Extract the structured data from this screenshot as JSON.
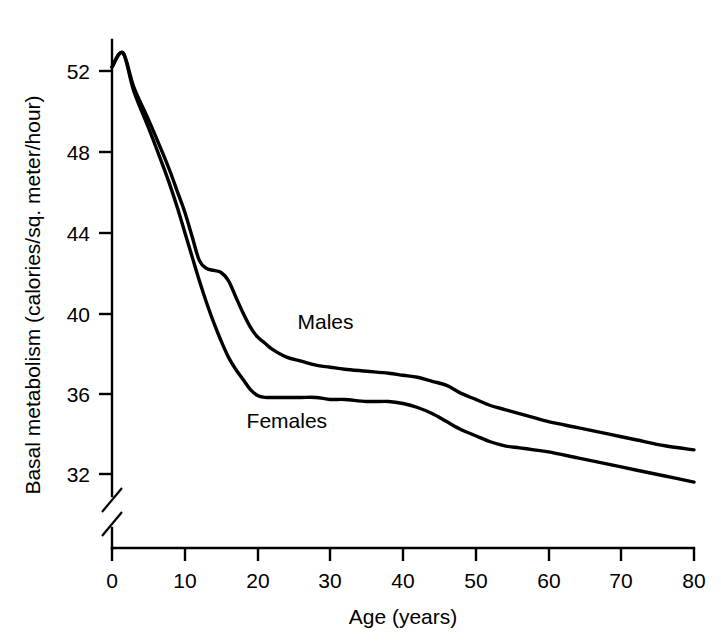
{
  "chart_data": {
    "type": "line",
    "title": "",
    "xlabel": "Age (years)",
    "ylabel": "Basal metabolism (calories/sq. meter/hour)",
    "xlim": [
      0,
      80
    ],
    "ylim": [
      30,
      54
    ],
    "xticks": [
      0,
      10,
      20,
      30,
      40,
      50,
      60,
      70,
      80
    ],
    "yticks": [
      32,
      36,
      40,
      44,
      48,
      52
    ],
    "xtick_labels": [
      "0",
      "10",
      "20",
      "30",
      "40",
      "50",
      "60",
      "70",
      "80"
    ],
    "ytick_labels": [
      "32",
      "36",
      "40",
      "44",
      "48",
      "52"
    ],
    "grid": false,
    "legend_position": "inline-annotation",
    "y_axis_break": true,
    "x": [
      0,
      1.5,
      3,
      5,
      7,
      8,
      9,
      10,
      11,
      12,
      13,
      14,
      15,
      16,
      17,
      18,
      19,
      20,
      21,
      22,
      24,
      26,
      28,
      30,
      32,
      35,
      38,
      40,
      42,
      44,
      46,
      48,
      50,
      52,
      54,
      56,
      58,
      60,
      64,
      68,
      72,
      76,
      80
    ],
    "series": [
      {
        "name": "Males",
        "values": [
          52.2,
          52.9,
          51.2,
          49.6,
          47.9,
          47.0,
          46.0,
          45.0,
          43.8,
          42.6,
          42.2,
          42.1,
          42.0,
          41.6,
          40.8,
          40.0,
          39.3,
          38.8,
          38.5,
          38.2,
          37.8,
          37.6,
          37.4,
          37.3,
          37.2,
          37.1,
          37.0,
          36.9,
          36.8,
          36.6,
          36.4,
          36.0,
          35.7,
          35.4,
          35.2,
          35.0,
          34.8,
          34.6,
          34.3,
          34.0,
          33.7,
          33.4,
          33.2
        ]
      },
      {
        "name": "Females",
        "values": [
          52.2,
          52.9,
          51.0,
          49.2,
          47.3,
          46.3,
          45.2,
          44.0,
          42.8,
          41.6,
          40.5,
          39.5,
          38.6,
          37.8,
          37.2,
          36.7,
          36.2,
          35.9,
          35.8,
          35.8,
          35.8,
          35.8,
          35.8,
          35.7,
          35.7,
          35.6,
          35.6,
          35.5,
          35.3,
          35.0,
          34.6,
          34.2,
          33.9,
          33.6,
          33.4,
          33.3,
          33.2,
          33.1,
          32.8,
          32.5,
          32.2,
          31.9,
          31.6
        ]
      }
    ],
    "annotations": [
      {
        "text": "Males",
        "x": 25.5,
        "y": 39.2
      },
      {
        "text": "Females",
        "x": 18.5,
        "y": 34.3
      }
    ]
  },
  "colors": {
    "background": "#ffffff",
    "axis": "#000000",
    "curve": "#000000",
    "text": "#000000"
  }
}
